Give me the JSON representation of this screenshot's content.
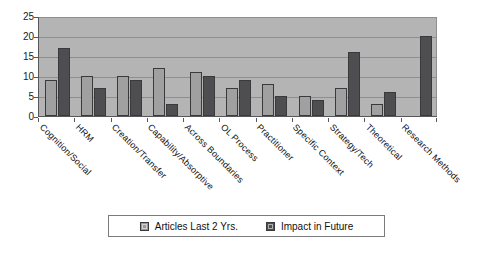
{
  "chart_data": {
    "type": "bar",
    "title": "",
    "subtitle": "",
    "xlabel": "",
    "ylabel": "",
    "ylim": [
      0,
      25
    ],
    "ytick_values": [
      0,
      5,
      10,
      15,
      20,
      25
    ],
    "ytick_labels": [
      "0",
      "5",
      "10",
      "15",
      "20",
      "25"
    ],
    "grid": true,
    "grid_axis": "y",
    "legend_position": "bottom-center",
    "orientation": "vertical",
    "categories": [
      "Cognition/Social",
      "HRM",
      "Creation/Transfer",
      "Capability/Absorptive",
      "Across Boundaries",
      "OL Process",
      "Practitioner",
      "Specific Context",
      "Strategy/Tech",
      "Theoretical",
      "Research Methods"
    ],
    "series": [
      {
        "name": "Articles Last 2 Yrs.",
        "color": "#a0a0a0",
        "values": [
          9,
          10,
          10,
          12,
          11,
          7,
          8,
          5,
          7,
          3,
          0
        ]
      },
      {
        "name": "Impact in Future",
        "color": "#4e4e50",
        "values": [
          17,
          7,
          9,
          3,
          10,
          9,
          5,
          4,
          16,
          6,
          20
        ]
      }
    ]
  },
  "legend": {
    "entries": [
      {
        "label": "Articles Last 2 Yrs.",
        "swatch": "light-gray-swatch"
      },
      {
        "label": "Impact in Future",
        "swatch": "dark-gray-swatch"
      }
    ]
  },
  "colors": {
    "page_background": "#ffffff",
    "plot_background": "#b4b4b4",
    "gridline": "#8e8e90",
    "axis": "#58585a",
    "series_light": "#a0a0a0",
    "series_dark": "#4e4e50",
    "text": "#111111"
  }
}
